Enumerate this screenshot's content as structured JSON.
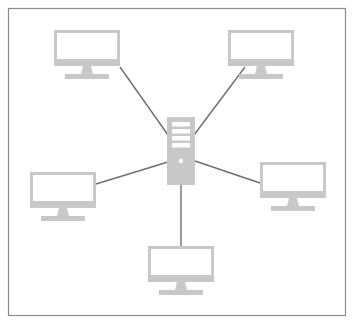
{
  "diagram": {
    "type": "star-network-topology",
    "frame": {
      "x": 8.5,
      "y": 8.5,
      "width": 337,
      "height": 307,
      "stroke": "#8a8a8a"
    },
    "colors": {
      "device": "#c8c8c8",
      "device_inner": "#ffffff",
      "link": "#6e6e6e",
      "background": "#ffffff"
    },
    "hub": {
      "name": "server",
      "icon": "server-tower-icon",
      "x": 167,
      "y": 117,
      "width": 28,
      "height": 68
    },
    "nodes": [
      {
        "name": "computer-top-left",
        "icon": "desktop-monitor-icon",
        "x": 54,
        "y": 30,
        "w": 66,
        "h": 36
      },
      {
        "name": "computer-top-right",
        "icon": "desktop-monitor-icon",
        "x": 228,
        "y": 30,
        "w": 66,
        "h": 36
      },
      {
        "name": "computer-left",
        "icon": "desktop-monitor-icon",
        "x": 30,
        "y": 172,
        "w": 66,
        "h": 36
      },
      {
        "name": "computer-right",
        "icon": "desktop-monitor-icon",
        "x": 260,
        "y": 162,
        "w": 66,
        "h": 36
      },
      {
        "name": "computer-bottom",
        "icon": "desktop-monitor-icon",
        "x": 148,
        "y": 246,
        "w": 66,
        "h": 36
      }
    ],
    "links": [
      {
        "name": "link-top-left",
        "x1": 120,
        "y1": 67,
        "x2": 168,
        "y2": 135
      },
      {
        "name": "link-top-right",
        "x1": 245,
        "y1": 67,
        "x2": 194,
        "y2": 135
      },
      {
        "name": "link-left",
        "x1": 96,
        "y1": 184,
        "x2": 168,
        "y2": 162
      },
      {
        "name": "link-right",
        "x1": 195,
        "y1": 161,
        "x2": 260,
        "y2": 183
      },
      {
        "name": "link-bottom",
        "x1": 181,
        "y1": 185,
        "x2": 181,
        "y2": 246
      }
    ]
  }
}
